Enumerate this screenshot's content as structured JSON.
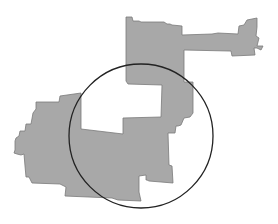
{
  "map": {
    "width": 278,
    "height": 224,
    "background": "#ffffff",
    "region": {
      "fill": "#a8a8a8",
      "stroke": "#7a7a7a",
      "points": "126,17 132,17 133,21 139,21 141,22 164,22 167,24 170,24 172,25 182,26 182,35 212,34 218,33 238,34 239,26 244,25 247,20 257,18 257,27 256,36 259,38 257,46 263,46 261,50 257,48 254,48 255,55 232,56 231,51 229,51 184,50 184,82 193,82 193,113 190,117 184,118 181,125 178,126 176,126 175,133 168,133 169,165 172,166 173,183 149,181 147,180 146,180 146,175 139,176 139,192 141,201 118,200 112,198 65,196 66,187 60,184 32,183 29,177 26,177 25,166 24,154 21,155 17,154 14,153 15,150 15,141 16,138 19,136 20,131 25,131 26,124 31,124 33,113 36,109 36,102 59,102 60,96 81,93 81,129 123,134 123,118 161,117 162,85 128,84 126,81 126,17"
    },
    "circle": {
      "cx": 141,
      "cy": 136,
      "r": 72,
      "stroke": "#222222",
      "stroke_width": 1.3
    }
  }
}
